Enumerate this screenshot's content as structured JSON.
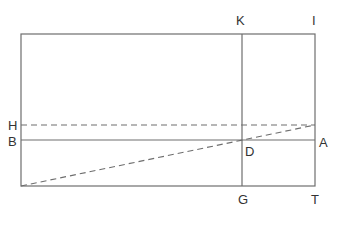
{
  "diagram": {
    "colors": {
      "line": "#6e6e6e",
      "text": "#333333",
      "background": "#ffffff"
    },
    "labels": {
      "K": "K",
      "I": "I",
      "H": "H",
      "B": "B",
      "A": "A",
      "D": "D",
      "G": "G",
      "T": "T"
    },
    "elements": [
      {
        "id": "outer-rectangle",
        "type": "rect",
        "style": "solid"
      },
      {
        "id": "line-KG",
        "type": "line",
        "style": "solid",
        "from": "K",
        "to": "G"
      },
      {
        "id": "line-BA",
        "type": "line",
        "style": "solid",
        "from": "B",
        "to": "A"
      },
      {
        "id": "line-H",
        "type": "line",
        "style": "dashed",
        "from": "H",
        "to": "right-edge"
      },
      {
        "id": "diagonal",
        "type": "line",
        "style": "dashed",
        "from": "bottom-left-corner",
        "to": "right-edge",
        "through": "D"
      }
    ]
  }
}
